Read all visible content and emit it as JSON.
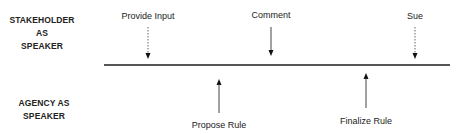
{
  "roles": {
    "stakeholder": [
      "STAKEHOLDER AS",
      "SPEAKER"
    ],
    "agency": [
      "AGENCY AS",
      "SPEAKER"
    ]
  },
  "stakeholder_events": [
    {
      "label": "Provide Input",
      "x": 148,
      "style": "dotted"
    },
    {
      "label": "Comment",
      "x": 271,
      "style": "solid"
    },
    {
      "label": "Sue",
      "x": 415,
      "style": "dotted"
    }
  ],
  "agency_events": [
    {
      "label": "Propose Rule",
      "x": 219,
      "style": "solid"
    },
    {
      "label": "Finalize Rule",
      "x": 366,
      "style": "solid"
    }
  ]
}
